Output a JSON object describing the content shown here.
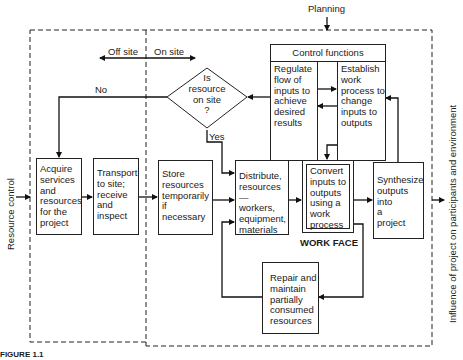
{
  "diagram": {
    "top_input": "Planning",
    "left_input": "Resource control",
    "right_output": "Influence of project on participants and environment",
    "zones": {
      "off_site": "Off site",
      "on_site": "On site"
    },
    "decision": {
      "text": "Is\nresource\non site\n?",
      "no_label": "No",
      "yes_label": "Yes"
    },
    "control_functions": {
      "title": "Control functions",
      "regulate": "Regulate\nflow of\ninputs to\nachieve\ndesired\nresults",
      "establish": "Establish\nwork\nprocess to\nchange\ninputs to\noutputs"
    },
    "boxes": {
      "acquire": "Acquire\nservices\nand\nresources\nfor the\nproject",
      "transport": "Transport\nto site;\nreceive\nand\ninspect",
      "store": "Store\nresources\ntemporarily\nif\nnecessary",
      "distribute": "Distribute,\nresources—\nworkers,\nequipment,\nmaterials",
      "convert": "Convert\ninputs to\noutputs\nusing a\nwork\nprocess",
      "synthesize": "Synthesize\noutputs\ninto\na\nproject",
      "repair": "Repair and\nmaintain\npartially\nconsumed\nresources"
    },
    "work_face_label": "WORK FACE",
    "caption_partial": "FIGURE 1.1"
  }
}
